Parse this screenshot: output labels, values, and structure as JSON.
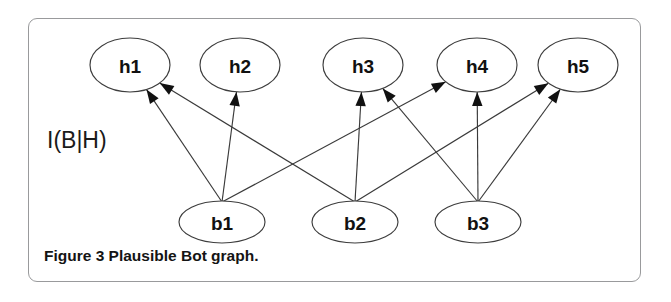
{
  "figure": {
    "caption_prefix": "Figure 3",
    "caption_text": " Plausible Bot graph.",
    "set_label": "I(B|H)",
    "border_color": "#999a9c",
    "background_color": "#ffffff",
    "node_stroke_color": "#3d3d3d",
    "edge_color": "#3a3a3a",
    "text_color": "#111111"
  },
  "graph": {
    "type": "bipartite-directed-graph",
    "node_label_font_size": 19,
    "top_nodes": [
      {
        "id": "h1",
        "label": "h1",
        "cx": 130,
        "cy": 65,
        "rx": 40,
        "ry": 27
      },
      {
        "id": "h2",
        "label": "h2",
        "cx": 240,
        "cy": 65,
        "rx": 40,
        "ry": 27
      },
      {
        "id": "h3",
        "label": "h3",
        "cx": 363,
        "cy": 65,
        "rx": 40,
        "ry": 27
      },
      {
        "id": "h4",
        "label": "h4",
        "cx": 477,
        "cy": 65,
        "rx": 40,
        "ry": 27
      },
      {
        "id": "h5",
        "label": "h5",
        "cx": 578,
        "cy": 65,
        "rx": 40,
        "ry": 27
      }
    ],
    "bottom_nodes": [
      {
        "id": "b1",
        "label": "b1",
        "cx": 222,
        "cy": 222,
        "rx": 43,
        "ry": 21
      },
      {
        "id": "b2",
        "label": "b2",
        "cx": 355,
        "cy": 222,
        "rx": 43,
        "ry": 21
      },
      {
        "id": "b3",
        "label": "b3",
        "cx": 478,
        "cy": 222,
        "rx": 43,
        "ry": 21
      }
    ],
    "edges": [
      {
        "from": "b1",
        "to": "h1"
      },
      {
        "from": "b1",
        "to": "h2"
      },
      {
        "from": "b1",
        "to": "h4"
      },
      {
        "from": "b2",
        "to": "h1"
      },
      {
        "from": "b2",
        "to": "h3"
      },
      {
        "from": "b2",
        "to": "h5"
      },
      {
        "from": "b3",
        "to": "h3"
      },
      {
        "from": "b3",
        "to": "h4"
      },
      {
        "from": "b3",
        "to": "h5"
      }
    ]
  }
}
